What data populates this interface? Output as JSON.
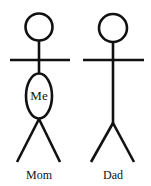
{
  "figures": [
    {
      "name": "Mom",
      "label": "Mom",
      "belly_text": "Me"
    },
    {
      "name": "Dad",
      "label": "Dad"
    }
  ],
  "colors": {
    "stroke": "#111111",
    "background": "#ffffff"
  }
}
